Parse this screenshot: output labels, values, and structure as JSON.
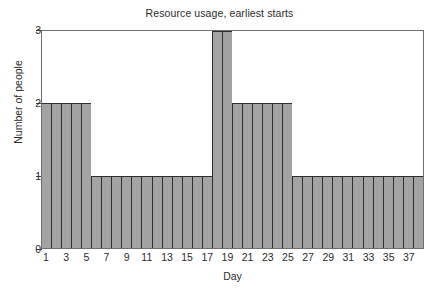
{
  "chart_data": {
    "type": "bar",
    "title": "Resource usage, earliest starts",
    "xlabel": "Day",
    "ylabel": "Number of people",
    "categories": [
      1,
      2,
      3,
      4,
      5,
      6,
      7,
      8,
      9,
      10,
      11,
      12,
      13,
      14,
      15,
      16,
      17,
      18,
      19,
      20,
      21,
      22,
      23,
      24,
      25,
      26,
      27,
      28,
      29,
      30,
      31,
      32,
      33,
      34,
      35,
      36,
      37,
      38
    ],
    "values": [
      2,
      2,
      2,
      2,
      2,
      1,
      1,
      1,
      1,
      1,
      1,
      1,
      1,
      1,
      1,
      1,
      1,
      3,
      3,
      2,
      2,
      2,
      2,
      2,
      2,
      1,
      1,
      1,
      1,
      1,
      1,
      1,
      1,
      1,
      1,
      1,
      1,
      1
    ],
    "ylim": [
      0,
      3
    ],
    "xlim": [
      1,
      38
    ],
    "y_ticks": [
      "0",
      "1",
      "2",
      "3"
    ],
    "y_tick_values": [
      0,
      1,
      2,
      3
    ],
    "x_tick_labels": [
      "1",
      "",
      "3",
      "",
      "5",
      "",
      "7",
      "",
      "9",
      "",
      "11",
      "",
      "13",
      "",
      "15",
      "",
      "17",
      "",
      "19",
      "",
      "21",
      "",
      "23",
      "",
      "25",
      "",
      "27",
      "",
      "29",
      "",
      "31",
      "",
      "33",
      "",
      "35",
      "",
      "37",
      ""
    ],
    "grid": false,
    "legend": null,
    "bar_color": "#a3a3a3",
    "bar_edge_color": "#2e2e2e",
    "axis_color": "#6f6f6f",
    "text_color": "#2b2b2b"
  }
}
